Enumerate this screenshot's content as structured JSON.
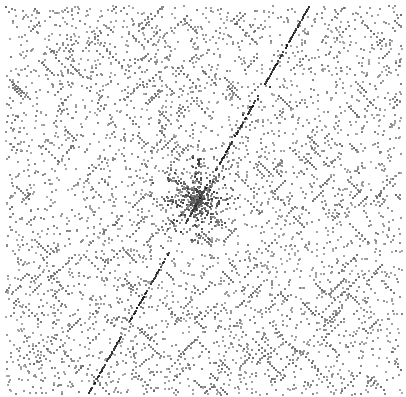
{
  "figure": {
    "title": "Sequence Self-Comparison Dot Plot",
    "caption": "",
    "width": 406,
    "height": 397,
    "background_color": "#ffffff"
  },
  "chart_data": {
    "type": "scatter",
    "title": "Sequence Self-Comparison Dot Plot",
    "subtitle": "",
    "xlabel": "",
    "ylabel": "",
    "xlim": [
      0,
      406
    ],
    "ylim": [
      0,
      397
    ],
    "grid": false,
    "legend": "none",
    "axes_visible": false,
    "tick_labels_x": [],
    "tick_labels_y": [],
    "marker": {
      "shape": "square",
      "size_px": 2,
      "noise_color": "#8c8c8c",
      "match_color": "#2b2b2b",
      "cluster_color": "#404040"
    },
    "plot_box": {
      "x": 5,
      "y": 5,
      "width": 396,
      "height": 389
    },
    "noise": {
      "description": "uniform random background matches",
      "count": 3600,
      "color": "#8c8c8c",
      "seed": 20240917
    },
    "runs": {
      "description": "short diagonal match runs scattered through the matrix",
      "count": 300,
      "length_min": 2,
      "length_max": 7,
      "color": "#777777",
      "slope_choices": [
        -1,
        1
      ]
    },
    "main_diagonal": {
      "description": "dominant anti-diagonal self-match line running from lower-left to upper-right",
      "slope": -1,
      "start_point": [
        88,
        392
      ],
      "end_point": [
        308,
        6
      ],
      "color": "#2a2a2a",
      "thickness_px": 2,
      "density": 0.62,
      "gaps": [
        {
          "from_x": 168,
          "to_x": 186
        },
        {
          "from_x": 200,
          "to_x": 214
        },
        {
          "from_x": 255,
          "to_x": 263
        },
        {
          "from_x": 120,
          "to_x": 128
        }
      ]
    },
    "center_cluster": {
      "description": "dense star / cross shaped cluster of matches near the plot centre",
      "center": [
        196,
        200
      ],
      "radius": 42,
      "count": 420,
      "color": "#404040",
      "arm_count": 8
    },
    "secondary_diagonals": [
      {
        "start_point": [
          150,
          260
        ],
        "end_point": [
          238,
          170
        ],
        "slope": -1,
        "density": 0.22,
        "color": "#555555"
      },
      {
        "start_point": [
          152,
          182
        ],
        "end_point": [
          232,
          262
        ],
        "slope": 1,
        "density": 0.2,
        "color": "#555555"
      },
      {
        "start_point": [
          236,
          120
        ],
        "end_point": [
          284,
          70
        ],
        "slope": -1,
        "density": 0.3,
        "color": "#3a3a3a"
      }
    ]
  }
}
